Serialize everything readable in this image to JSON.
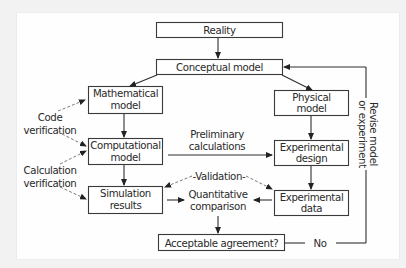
{
  "diagram": {
    "type": "flowchart",
    "title": "",
    "nodes": {
      "reality": "Reality",
      "conceptual": "Conceptual model",
      "mathematical": [
        "Mathematical",
        "model"
      ],
      "physical": [
        "Physical",
        "model"
      ],
      "computational": [
        "Computational",
        "model"
      ],
      "experimental_design": [
        "Experimental",
        "design"
      ],
      "simulation": [
        "Simulation",
        "results"
      ],
      "experimental_data": [
        "Experimental",
        "data"
      ],
      "quantitative": [
        "Quantitative",
        "comparison"
      ],
      "acceptable": "Acceptable agreement?"
    },
    "labels": {
      "code_verification": [
        "Code",
        "verification"
      ],
      "calculation_verification": [
        "Calculation",
        "verification"
      ],
      "preliminary": [
        "Preliminary",
        "calculations"
      ],
      "validation": "-Validation-",
      "no": "No",
      "revise": [
        "Revise model",
        "or experiment"
      ]
    },
    "edges": [
      {
        "from": "Reality",
        "to": "Conceptual model",
        "style": "solid"
      },
      {
        "from": "Conceptual model",
        "to": "Mathematical model",
        "style": "solid"
      },
      {
        "from": "Conceptual model",
        "to": "Physical model",
        "style": "solid"
      },
      {
        "from": "Mathematical model",
        "to": "Computational model",
        "style": "solid"
      },
      {
        "from": "Physical model",
        "to": "Experimental design",
        "style": "solid"
      },
      {
        "from": "Computational model",
        "to": "Experimental design",
        "style": "solid",
        "label": "Preliminary calculations"
      },
      {
        "from": "Computational model",
        "to": "Simulation results",
        "style": "solid"
      },
      {
        "from": "Experimental design",
        "to": "Experimental data",
        "style": "solid"
      },
      {
        "from": "Simulation results",
        "to": "Quantitative comparison",
        "style": "solid"
      },
      {
        "from": "Experimental data",
        "to": "Quantitative comparison",
        "style": "solid"
      },
      {
        "from": "Quantitative comparison",
        "to": "Acceptable agreement?",
        "style": "solid"
      },
      {
        "from": "Acceptable agreement?",
        "to": "Conceptual model",
        "style": "solid",
        "label": "No / Revise model or experiment"
      },
      {
        "from": "Code verification",
        "to": "Mathematical model",
        "style": "dashed"
      },
      {
        "from": "Code verification",
        "to": "Computational model",
        "style": "dashed"
      },
      {
        "from": "Calculation verification",
        "to": "Computational model",
        "style": "dashed"
      },
      {
        "from": "Calculation verification",
        "to": "Simulation results",
        "style": "dashed"
      },
      {
        "from": "Validation",
        "to": "Simulation results",
        "style": "dashed"
      },
      {
        "from": "Validation",
        "to": "Experimental data",
        "style": "dashed"
      }
    ]
  }
}
